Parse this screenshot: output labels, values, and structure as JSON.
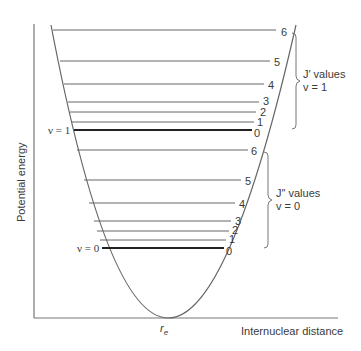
{
  "diagram": {
    "type": "potential_energy_well_with_rotational_levels",
    "y_axis_label": "Potential energy",
    "x_axis_label": "Internuclear distance",
    "equilibrium_label": "r",
    "equilibrium_subscript": "e",
    "vibrational_levels": [
      {
        "label": "v = 1",
        "J_labels": [
          "0",
          "1",
          "2",
          "3",
          "4",
          "5",
          "6"
        ]
      },
      {
        "label": "v = 0",
        "J_labels": [
          "0",
          "1",
          "2",
          "3",
          "4",
          "5",
          "6"
        ]
      }
    ],
    "bracket_upper": {
      "line1": "J′ values",
      "line2": "v = 1"
    },
    "bracket_lower": {
      "line1": "J″ values",
      "line2": "v = 0"
    },
    "colors": {
      "line": "#555555",
      "bold_line": "#222222",
      "text": "#3a3a3a"
    }
  },
  "labels": {
    "v1": "ν = 1",
    "v0": "ν = 0",
    "upper": {
      "j0": "0",
      "j1": "1",
      "j2": "2",
      "j3": "3",
      "j4": "4",
      "j5": "5",
      "j6": "6",
      "title": "J′ values",
      "sub": "v = 1"
    },
    "lower": {
      "j0": "0",
      "j1": "1",
      "j2": "2",
      "j3": "3",
      "j4": "4",
      "j5": "5",
      "j6": "6",
      "title": "J″ values",
      "sub": "v = 0"
    },
    "y_axis": "Potential energy",
    "x_axis": "Internuclear distance",
    "re": "r",
    "re_sub": "e"
  }
}
